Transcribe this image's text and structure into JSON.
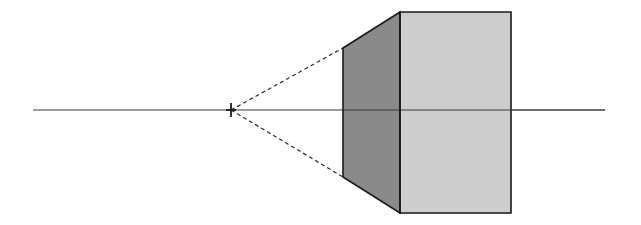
{
  "canvas": {
    "width": 641,
    "height": 225,
    "background_color": "#ffffff",
    "title": "One-point perspective cube with horizon line and vanishing point"
  },
  "colors": {
    "background": "#ffffff",
    "front_face_fill": "#cdcdcd",
    "side_face_fill": "#8a8a8a",
    "outline_stroke": "#1a1a1a",
    "horizon_stroke": "#3a3a3a",
    "construction_stroke": "#2b2b2b",
    "vanishing_point_stroke": "#1a1a1a"
  },
  "chart_data": {
    "type": "diagram",
    "vanishing_point": {
      "x": 231,
      "y": 110,
      "marker": "tick"
    },
    "horizon_line": {
      "x1": 33,
      "y1": 110,
      "x2": 605,
      "y2": 110
    },
    "front_face": {
      "label": "front-face",
      "fill": "#cdcdcd",
      "points": [
        {
          "x": 400,
          "y": 12
        },
        {
          "x": 511,
          "y": 12
        },
        {
          "x": 511,
          "y": 213
        },
        {
          "x": 400,
          "y": 213
        }
      ]
    },
    "side_face": {
      "label": "left-side-face",
      "fill": "#8a8a8a",
      "points": [
        {
          "x": 343,
          "y": 48
        },
        {
          "x": 400,
          "y": 12
        },
        {
          "x": 400,
          "y": 213
        },
        {
          "x": 343,
          "y": 177
        }
      ]
    },
    "construction_lines": [
      {
        "label": "upper-receding-line",
        "style": "dashed",
        "x1": 231,
        "y1": 110,
        "x2": 343,
        "y2": 48
      },
      {
        "label": "lower-receding-line",
        "style": "dashed",
        "x1": 231,
        "y1": 110,
        "x2": 343,
        "y2": 177
      }
    ],
    "edges": [
      {
        "label": "front-top-edge",
        "x1": 400,
        "y1": 12,
        "x2": 511,
        "y2": 12
      },
      {
        "label": "front-right-edge",
        "x1": 511,
        "y1": 12,
        "x2": 511,
        "y2": 213
      },
      {
        "label": "front-bottom-edge",
        "x1": 511,
        "y1": 213,
        "x2": 400,
        "y2": 213
      },
      {
        "label": "front-left-edge",
        "x1": 400,
        "y1": 12,
        "x2": 400,
        "y2": 213
      },
      {
        "label": "back-top-receding-edge",
        "x1": 343,
        "y1": 48,
        "x2": 400,
        "y2": 12
      },
      {
        "label": "back-vertical-edge",
        "x1": 343,
        "y1": 48,
        "x2": 343,
        "y2": 177
      },
      {
        "label": "back-bottom-receding-edge",
        "x1": 343,
        "y1": 177,
        "x2": 400,
        "y2": 213
      }
    ]
  },
  "annotations": {
    "vanishing_point_label": "",
    "horizon_label": "",
    "front_face_label": "",
    "side_face_label": ""
  }
}
